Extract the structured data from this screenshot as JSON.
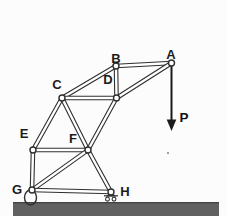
{
  "figure": "pin-jointed truss frame on ground with vertical load",
  "colors": {
    "background": "#fcfcfc",
    "line": "#2f2f2f",
    "member_gap": "#ffffff",
    "arrow": "#1a1a1a",
    "ground": "#616161",
    "ground_edge": "#424242",
    "label": "#1b1b1b"
  },
  "joints": [
    {
      "id": "A",
      "label": "A",
      "x": 171.5,
      "y": 63,
      "label_x": 171,
      "label_y": 54
    },
    {
      "id": "B",
      "label": "B",
      "x": 116,
      "y": 66,
      "label_x": 116,
      "label_y": 58
    },
    {
      "id": "C",
      "label": "C",
      "x": 62,
      "y": 98,
      "label_x": 57,
      "label_y": 84
    },
    {
      "id": "D",
      "label": "D",
      "x": 116.5,
      "y": 98,
      "label_x": 108,
      "label_y": 79
    },
    {
      "id": "E",
      "label": "E",
      "x": 33,
      "y": 150,
      "label_x": 24,
      "label_y": 133
    },
    {
      "id": "F",
      "label": "F",
      "x": 88,
      "y": 150,
      "label_x": 73,
      "label_y": 138
    },
    {
      "id": "G",
      "label": "G",
      "x": 32,
      "y": 190,
      "label_x": 17,
      "label_y": 189
    },
    {
      "id": "H",
      "label": "H",
      "x": 111,
      "y": 192,
      "label_x": 125,
      "label_y": 191
    }
  ],
  "members": [
    [
      "A",
      "B"
    ],
    [
      "A",
      "D"
    ],
    [
      "B",
      "D"
    ],
    [
      "B",
      "C"
    ],
    [
      "C",
      "D"
    ],
    [
      "C",
      "E"
    ],
    [
      "C",
      "F"
    ],
    [
      "D",
      "F"
    ],
    [
      "E",
      "F"
    ],
    [
      "E",
      "G"
    ],
    [
      "F",
      "G"
    ],
    [
      "F",
      "H"
    ],
    [
      "G",
      "H"
    ]
  ],
  "load": {
    "label": "P",
    "at_joint": "A",
    "direction": "down",
    "x": 171.5,
    "y_start": 66,
    "y_tip": 131,
    "head_half_width": 4.8,
    "head_length": 11.5,
    "label_x": 184,
    "label_y": 118
  },
  "supports": [
    {
      "joint": "G",
      "type": "rocker",
      "ellipse": {
        "cx": 30.5,
        "cy": 197.5,
        "rx": 6,
        "ry": 7.5
      }
    },
    {
      "joint": "H",
      "type": "roller",
      "bar": {
        "x1": 104,
        "x2": 118,
        "y": 195.8
      },
      "shoe": [
        [
          111,
          192.5
        ],
        [
          107.3,
          196
        ],
        [
          114.7,
          196
        ]
      ],
      "wheels": [
        {
          "cx": 107.5,
          "cy": 199.2,
          "r": 1.9
        },
        {
          "cx": 114,
          "cy": 199.2,
          "r": 1.9
        }
      ]
    }
  ],
  "ground": {
    "x": 13,
    "y": 202,
    "width": 206,
    "height": 14
  },
  "speck": {
    "x": 168,
    "y": 153,
    "r": 1.1
  }
}
